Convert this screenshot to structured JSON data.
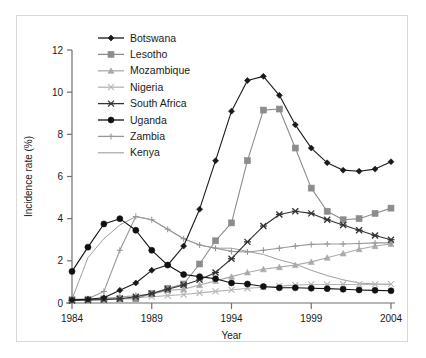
{
  "chart_data": {
    "type": "line",
    "title": "",
    "xlabel": "Year",
    "ylabel": "Incidence rate (%)",
    "xlim": [
      1984,
      2004
    ],
    "ylim": [
      0,
      12
    ],
    "xticks": [
      1984,
      1989,
      1994,
      1999,
      2004
    ],
    "yticks": [
      0,
      2,
      4,
      6,
      8,
      10,
      12
    ],
    "grid": false,
    "legend_position": "top-left-inside",
    "x": [
      1984,
      1985,
      1986,
      1987,
      1988,
      1989,
      1990,
      1991,
      1992,
      1993,
      1994,
      1995,
      1996,
      1997,
      1998,
      1999,
      2000,
      2001,
      2002,
      2003,
      2004
    ],
    "series": [
      {
        "name": "Botswana",
        "marker": "diamond",
        "color": "#1a1a1a",
        "values": [
          0.15,
          0.18,
          0.25,
          0.6,
          0.95,
          1.55,
          1.8,
          2.7,
          4.45,
          6.75,
          9.1,
          10.55,
          10.75,
          9.85,
          8.45,
          7.35,
          6.65,
          6.3,
          6.25,
          6.35,
          6.7
        ]
      },
      {
        "name": "Lesotho",
        "marker": "square",
        "color": "#8c8c8c",
        "values": [
          0.15,
          0.15,
          0.18,
          0.2,
          0.2,
          0.45,
          0.7,
          0.9,
          1.85,
          2.95,
          3.8,
          6.75,
          9.15,
          9.2,
          7.35,
          5.45,
          4.35,
          3.95,
          4.0,
          4.25,
          4.5
        ]
      },
      {
        "name": "Mozambique",
        "marker": "triangle",
        "color": "#aaaaaa",
        "values": [
          0.15,
          0.18,
          0.22,
          0.28,
          0.35,
          0.42,
          0.6,
          0.65,
          0.85,
          1.05,
          1.25,
          1.45,
          1.6,
          1.7,
          1.8,
          1.95,
          2.15,
          2.35,
          2.55,
          2.7,
          2.8
        ]
      },
      {
        "name": "Nigeria",
        "marker": "x",
        "color": "#b5b5b5",
        "values": [
          0.18,
          0.2,
          0.22,
          0.2,
          0.25,
          0.3,
          0.35,
          0.4,
          0.48,
          0.55,
          0.62,
          0.7,
          0.75,
          0.8,
          0.85,
          0.88,
          0.88,
          0.88,
          0.88,
          0.88,
          0.9
        ]
      },
      {
        "name": "South Africa",
        "marker": "asterisk",
        "color": "#333333",
        "values": [
          0.12,
          0.14,
          0.16,
          0.2,
          0.3,
          0.45,
          0.65,
          0.85,
          1.1,
          1.45,
          2.1,
          2.9,
          3.65,
          4.2,
          4.35,
          4.25,
          3.95,
          3.7,
          3.45,
          3.2,
          3.0
        ]
      },
      {
        "name": "Uganda",
        "marker": "circle",
        "color": "#111111",
        "values": [
          1.5,
          2.65,
          3.75,
          4.0,
          3.45,
          2.5,
          1.8,
          1.35,
          1.25,
          1.15,
          0.95,
          0.9,
          0.78,
          0.72,
          0.72,
          0.7,
          0.68,
          0.65,
          0.62,
          0.6,
          0.58
        ]
      },
      {
        "name": "Zambia",
        "marker": "plus",
        "color": "#989898",
        "values": [
          0.12,
          0.2,
          0.55,
          2.5,
          4.1,
          3.95,
          3.5,
          3.05,
          2.75,
          2.6,
          2.45,
          2.42,
          2.5,
          2.6,
          2.7,
          2.78,
          2.8,
          2.8,
          2.82,
          2.85,
          2.85
        ]
      },
      {
        "name": "Kenya",
        "marker": "none",
        "color": "#9e9e9e",
        "values": [
          0.18,
          2.15,
          3.05,
          3.7,
          4.1,
          3.95,
          3.5,
          3.05,
          2.75,
          2.6,
          2.6,
          2.45,
          2.3,
          2.05,
          1.85,
          1.55,
          1.3,
          1.1,
          0.95,
          0.9,
          0.88
        ]
      }
    ]
  },
  "legend": {
    "entries": [
      {
        "label": "Botswana"
      },
      {
        "label": "Lesotho"
      },
      {
        "label": "Mozambique"
      },
      {
        "label": "Nigeria"
      },
      {
        "label": "South Africa"
      },
      {
        "label": "Uganda"
      },
      {
        "label": "Zambia"
      },
      {
        "label": "Kenya"
      }
    ]
  },
  "axes": {
    "x_title": "Year",
    "y_title": "Incidence rate (%)",
    "x_tick_labels": [
      "1984",
      "1989",
      "1994",
      "1999",
      "2004"
    ],
    "y_tick_labels": [
      "0",
      "2",
      "4",
      "6",
      "8",
      "10",
      "12"
    ]
  }
}
